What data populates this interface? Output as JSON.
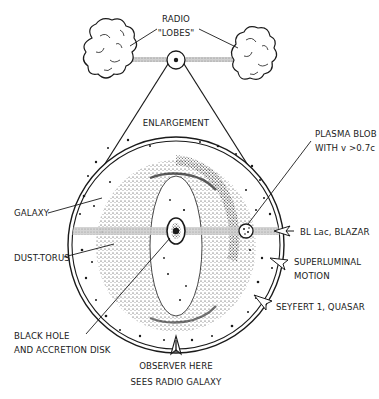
{
  "diagram": {
    "type": "agn-unified-model-illustration",
    "colors": {
      "ink": "#1a1a1a",
      "background": "#ffffff",
      "jet": "#b8b8b8"
    },
    "labels": {
      "radio_lobes_line1": "RADIO",
      "radio_lobes_line2": "\"LOBES\"",
      "enlargement": "ENLARGEMENT",
      "plasma_blob_line1": "PLASMA BLOB",
      "plasma_blob_line2": "WITH v >0.7c",
      "galaxy": "GALAXY",
      "dust_torus": "DUST-TORUS",
      "bl_lac": "BL Lac, BLAZAR",
      "superluminal_line1": "SUPERLUMINAL",
      "superluminal_line2": "MOTION",
      "seyfert": "SEYFERT 1, QUASAR",
      "black_hole_line1": "BLACK HOLE",
      "black_hole_line2": "AND ACCRETION DISK",
      "observer_line1": "OBSERVER HERE",
      "observer_line2": "SEES RADIO GALAXY"
    },
    "nodes": [
      {
        "id": "radio-lobe-left",
        "label": "RADIO \"LOBES\""
      },
      {
        "id": "radio-lobe-right",
        "label": "RADIO \"LOBES\""
      },
      {
        "id": "core",
        "label": ""
      },
      {
        "id": "galaxy",
        "label": "GALAXY"
      },
      {
        "id": "dust-torus",
        "label": "DUST-TORUS"
      },
      {
        "id": "black-hole",
        "label": "BLACK HOLE AND ACCRETION DISK"
      },
      {
        "id": "plasma-blob",
        "label": "PLASMA BLOB WITH v >0.7c"
      }
    ],
    "viewing_directions": [
      {
        "id": "observer-jet-axis",
        "label": "BL Lac, BLAZAR"
      },
      {
        "id": "observer-oblique",
        "label": "SUPERLUMINAL MOTION"
      },
      {
        "id": "observer-mid",
        "label": "SEYFERT 1, QUASAR"
      },
      {
        "id": "observer-edge-on",
        "label": "OBSERVER HERE SEES RADIO GALAXY"
      }
    ]
  }
}
